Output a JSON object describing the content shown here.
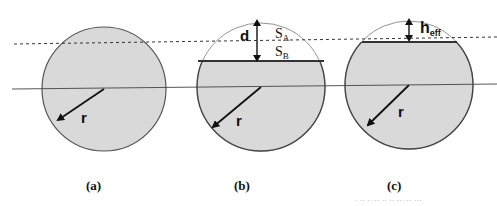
{
  "figure": {
    "panels": [
      {
        "id": "a",
        "caption": "(a)",
        "radius_label": "r"
      },
      {
        "id": "b",
        "caption": "(b)",
        "radius_label": "r",
        "depth_label": "d",
        "region_a_label": "S",
        "region_a_sub": "A",
        "region_b_label": "S",
        "region_b_sub": "B"
      },
      {
        "id": "c",
        "caption": "(c)",
        "radius_label": "r",
        "height_label": "h",
        "height_sub": "eff"
      }
    ],
    "colors": {
      "fill": "#d9d9d9",
      "stroke": "#404040",
      "background": "#ffffff"
    },
    "footer_text": "· ·· ·· ·· ·· ·· ··· ·· ···"
  }
}
